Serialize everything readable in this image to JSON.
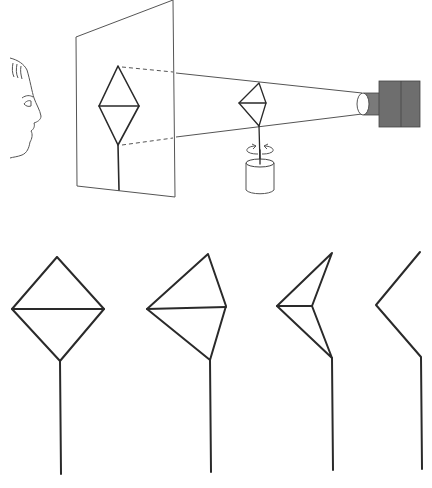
{
  "diagram": {
    "type": "kinetic-depth-effect-illustration",
    "top_scene": {
      "observer": "face-profile",
      "screen": {
        "shape": "translucent-panel",
        "shadow_figure": "diamond-on-stick"
      },
      "object": {
        "shape": "wire-diamond-on-rod",
        "rotating": true,
        "base": "cylinder"
      },
      "light_source": {
        "shape": "projector-box",
        "color": "#6e6e6e"
      }
    },
    "bottom_sequence": {
      "description": "shadow projections at successive rotation angles",
      "frames": [
        {
          "label": "frame-1",
          "view": "full diamond"
        },
        {
          "label": "frame-2",
          "view": "partially rotated"
        },
        {
          "label": "frame-3",
          "view": "further rotated"
        },
        {
          "label": "frame-4",
          "view": "edge view"
        }
      ]
    },
    "colors": {
      "stroke": "#2a2a2a",
      "projector": "#6e6e6e",
      "projector_tube": "#7a7a7a"
    }
  }
}
